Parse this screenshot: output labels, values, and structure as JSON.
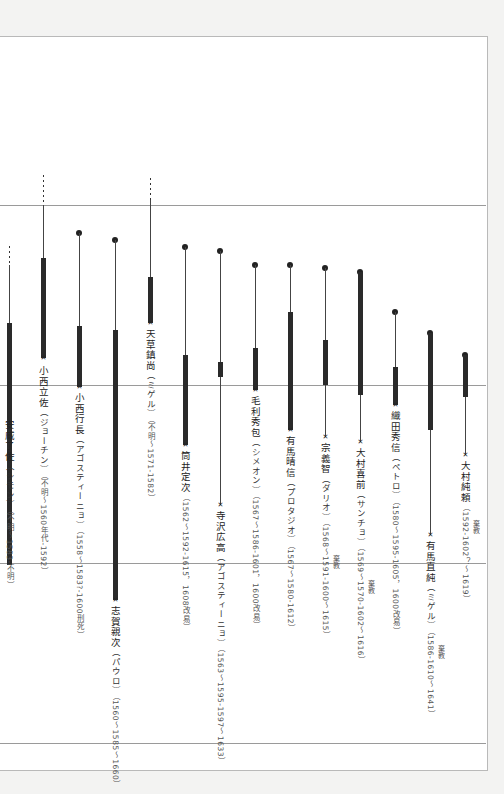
{
  "diagram": {
    "type": "vertical-timeline",
    "grid_lines_y": [
      205,
      385,
      563,
      743
    ],
    "legend": {
      "dot": "birth known",
      "dashed": "birth unknown",
      "thick": "Christian period",
      "star": "death"
    },
    "persons": [
      {
        "name": "安威了佐",
        "baptism": "（シモン）",
        "dates": "（不明～1583-不明）",
        "x": 9,
        "dashed": [
          246,
          265
        ],
        "dot": null,
        "thin": [
          265,
          323
        ],
        "thick": [
          323,
          565
        ],
        "thin2": null,
        "star": null,
        "label_top": 420,
        "note": null
      },
      {
        "name": "小西立佐",
        "baptism": "（ジョーチン）",
        "dates": "（不明～1560年代-1592）",
        "x": 43,
        "dashed": [
          175,
          205
        ],
        "dot": null,
        "thin": [
          205,
          258
        ],
        "thick": [
          258,
          358
        ],
        "thin2": null,
        "star": 358,
        "label_top": 366,
        "note": null
      },
      {
        "name": "小西行長",
        "baptism": "（アゴスティーニョ）",
        "dates": "（1558～1583?-1600刑死）",
        "x": 79,
        "dashed": null,
        "dot": 233,
        "thin": [
          233,
          326
        ],
        "thick": [
          326,
          387
        ],
        "thin2": null,
        "star": 387,
        "label_top": 393,
        "note": null
      },
      {
        "name": "志賀親次",
        "baptism": "（パウロ）",
        "dates": "（1560～1585～1660）",
        "x": 115,
        "dashed": null,
        "dot": 240,
        "thin": [
          240,
          330
        ],
        "thick": [
          330,
          600
        ],
        "thin2": null,
        "star": 600,
        "label_top": 606,
        "note": null
      },
      {
        "name": "天草鎮尚",
        "baptism": "（ミゲル）",
        "dates": "（不明～1571-1582）",
        "x": 150,
        "dashed": [
          178,
          200
        ],
        "dot": null,
        "thin": [
          200,
          277
        ],
        "thick": [
          277,
          323
        ],
        "thin2": null,
        "star": 323,
        "label_top": 329,
        "note": null
      },
      {
        "name": "筒井定次",
        "baptism": "",
        "dates": "（1562～1592-1615，1608改易）",
        "x": 185,
        "dashed": null,
        "dot": 247,
        "thin": [
          247,
          355
        ],
        "thick": [
          355,
          445
        ],
        "thin2": null,
        "star": 445,
        "label_top": 451,
        "note": null
      },
      {
        "name": "寺沢広高",
        "baptism": "（アゴスティーニョ）",
        "dates": "（1563～1595-1597～1633）",
        "x": 220,
        "dashed": null,
        "dot": 251,
        "thin": [
          251,
          362
        ],
        "thick": [
          362,
          377
        ],
        "thin2": [
          377,
          505
        ],
        "star": 505,
        "label_top": 511,
        "note": null
      },
      {
        "name": "毛利秀包",
        "baptism": "（シメオン）",
        "dates": "（1567～1586-1601，1600改易）",
        "x": 255,
        "dashed": null,
        "dot": 265,
        "thin": [
          265,
          348
        ],
        "thick": [
          348,
          390
        ],
        "thin2": null,
        "star": 390,
        "label_top": 396,
        "note": null
      },
      {
        "name": "有馬晴信",
        "baptism": "（プロタジオ）",
        "dates": "（1567～1580-1612）",
        "x": 290,
        "dashed": null,
        "dot": 265,
        "thin": [
          265,
          312
        ],
        "thick": [
          312,
          430
        ],
        "thin2": null,
        "star": 430,
        "label_top": 436,
        "note": null
      },
      {
        "name": "宗義智",
        "baptism": "（ダリオ）",
        "dates": "（1568～1591-1600～1615）",
        "x": 325,
        "dashed": null,
        "dot": 268,
        "thin": [
          268,
          340
        ],
        "thick": [
          340,
          385
        ],
        "thin2": [
          385,
          437
        ],
        "star": 437,
        "label_top": 443,
        "note": {
          "text": "棄教",
          "top": 555
        }
      },
      {
        "name": "大村喜前",
        "baptism": "（サンチョ）",
        "dates": "（1569～1570-1602～1616）",
        "x": 360,
        "dashed": null,
        "dot": 272,
        "thin": null,
        "thick": [
          272,
          395
        ],
        "thin2": [
          395,
          442
        ],
        "star": 442,
        "label_top": 448,
        "note": {
          "text": "棄教",
          "top": 580
        }
      },
      {
        "name": "織田秀信",
        "baptism": "（ペトロ）",
        "dates": "（1580～1595-1605，1600改易）",
        "x": 395,
        "dashed": null,
        "dot": 312,
        "thin": [
          312,
          367
        ],
        "thick": [
          367,
          405
        ],
        "thin2": null,
        "star": 405,
        "label_top": 411,
        "note": null
      },
      {
        "name": "有馬直純",
        "baptism": "（ミゲル）",
        "dates": "（1586-1610～1641）",
        "x": 430,
        "dashed": null,
        "dot": 333,
        "thin": null,
        "thick": [
          333,
          430
        ],
        "thin2": [
          430,
          535
        ],
        "star": 535,
        "label_top": 541,
        "note": {
          "text": "棄教",
          "top": 645
        }
      },
      {
        "name": "大村純頼",
        "baptism": "",
        "dates": "（1592-1602？～1619）",
        "x": 465,
        "dashed": null,
        "dot": 355,
        "thin": null,
        "thick": [
          355,
          397
        ],
        "thin2": [
          397,
          455
        ],
        "star": 455,
        "label_top": 461,
        "note": {
          "text": "棄教",
          "top": 520
        }
      }
    ]
  },
  "icons": {
    "star": "★",
    "dot": "●"
  }
}
